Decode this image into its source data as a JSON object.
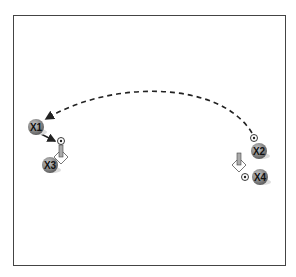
{
  "diagram": {
    "type": "soccer-drill",
    "players": [
      {
        "id": "x1",
        "label": "X1",
        "x": 36,
        "y": 127
      },
      {
        "id": "x2",
        "label": "X2",
        "x": 259,
        "y": 151
      },
      {
        "id": "x3",
        "label": "X3",
        "x": 50,
        "y": 165
      },
      {
        "id": "x4",
        "label": "X4",
        "x": 260,
        "y": 177
      }
    ],
    "balls": [
      {
        "x": 61,
        "y": 141
      },
      {
        "x": 254,
        "y": 138
      },
      {
        "x": 245,
        "y": 177
      }
    ],
    "cones": [
      {
        "x": 61,
        "y": 153
      },
      {
        "x": 239,
        "y": 161
      }
    ],
    "colors": {
      "player": "#8a8a8a",
      "border": "#444444",
      "line": "#222222"
    }
  }
}
